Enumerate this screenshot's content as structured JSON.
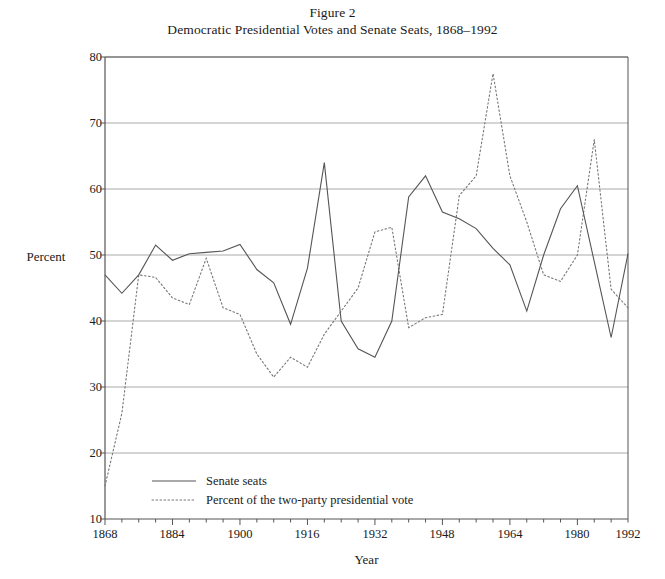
{
  "figure": {
    "title_line1": "Figure 2",
    "title_line2": "Democratic Presidential Votes and Senate Seats, 1868–1992"
  },
  "axes": {
    "ylabel": "Percent",
    "xlabel": "Year",
    "yticks": [
      "10",
      "20",
      "30",
      "40",
      "50",
      "60",
      "70",
      "80"
    ],
    "xticks": [
      "1868",
      "1884",
      "1900",
      "1916",
      "1932",
      "1948",
      "1964",
      "1980",
      "1992"
    ]
  },
  "legend": {
    "items": [
      {
        "label": "Senate seats",
        "style": "solid"
      },
      {
        "label": "Percent of the two-party presidential vote",
        "style": "dotted"
      }
    ]
  },
  "chart_data": {
    "type": "line",
    "title": "Democratic Presidential Votes and Senate Seats, 1868–1992",
    "subtitle": "Figure 2",
    "xlabel": "Year",
    "ylabel": "Percent",
    "xlim": [
      1868,
      1992
    ],
    "ylim": [
      10,
      80
    ],
    "ytick_step": 10,
    "xtick_step": 16,
    "grid": "horizontal",
    "legend_position": "inside-bottom-left",
    "x": [
      1868,
      1872,
      1876,
      1880,
      1884,
      1888,
      1892,
      1896,
      1900,
      1904,
      1908,
      1912,
      1916,
      1920,
      1924,
      1928,
      1932,
      1936,
      1940,
      1944,
      1948,
      1952,
      1956,
      1960,
      1964,
      1968,
      1972,
      1976,
      1980,
      1984,
      1988,
      1992
    ],
    "series": [
      {
        "name": "Senate seats",
        "style": "solid",
        "color": "#555555",
        "values": [
          47.0,
          44.2,
          47.0,
          51.5,
          49.2,
          50.2,
          50.4,
          50.6,
          51.6,
          47.8,
          45.8,
          39.5,
          48.0,
          64.0,
          40.0,
          35.8,
          34.5,
          40.0,
          58.8,
          62.0,
          56.5,
          55.5,
          54.0,
          51.0,
          48.5,
          41.5,
          50.0,
          57.0,
          60.5,
          49.0,
          37.5,
          50.2
        ]
      },
      {
        "name": "Percent of the two-party presidential vote",
        "style": "dotted",
        "color": "#777777",
        "values": [
          15.0,
          26.0,
          47.0,
          46.6,
          43.5,
          42.5,
          49.5,
          42.0,
          41.0,
          35.0,
          31.5,
          34.5,
          33.0,
          38.0,
          41.5,
          45.0,
          53.5,
          54.2,
          39.0,
          40.5,
          41.0,
          59.0,
          62.0,
          77.5,
          62.0,
          55.0,
          47.0,
          46.0,
          50.0,
          67.5,
          44.8,
          42.0
        ]
      }
    ],
    "series_note": {
      "senate_alignment": "values listed in x order 1868–1992 at 4-year intervals",
      "vote_alignment": "values listed in x order 1868–1992 at 4-year intervals"
    }
  },
  "plot_geometry": {
    "left_px": 105,
    "right_px": 628,
    "top_px": 57,
    "bottom_px": 519
  },
  "colors": {
    "axis": "#555555",
    "grid": "#aaaaaa",
    "senate_line": "#555555",
    "vote_line": "#777777",
    "text": "#1a1a1a"
  }
}
